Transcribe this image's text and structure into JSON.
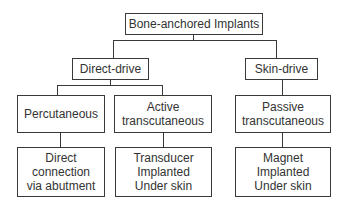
{
  "diagram": {
    "type": "tree",
    "root": {
      "label": "Bone-anchored Implants"
    },
    "level2": [
      {
        "label": "Direct-drive"
      },
      {
        "label": "Skin-drive"
      }
    ],
    "level3": [
      {
        "label": "Percutaneous",
        "parent": "Direct-drive"
      },
      {
        "label": "Active\ntranscutaneous",
        "parent": "Direct-drive"
      },
      {
        "label": "Passive\ntranscutaneous",
        "parent": "Skin-drive"
      }
    ],
    "level4": [
      {
        "label": "Direct\nconnection\nvia abutment",
        "parent": "Percutaneous"
      },
      {
        "label": "Transducer\nImplanted\nUnder skin",
        "parent": "Active transcutaneous"
      },
      {
        "label": "Magnet\nImplanted\nUnder skin",
        "parent": "Passive transcutaneous"
      }
    ]
  }
}
